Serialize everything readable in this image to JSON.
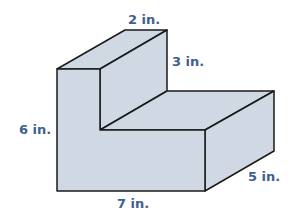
{
  "figure": {
    "type": "L-shaped prism",
    "fill_color": "#cfd8e3",
    "stroke_color": "#1a1a1a",
    "label_color": "#3f5f8f",
    "labels": {
      "top_width": "2 in.",
      "step_height": "3 in.",
      "total_height": "6 in.",
      "length": "7 in.",
      "depth": "5 in."
    }
  }
}
